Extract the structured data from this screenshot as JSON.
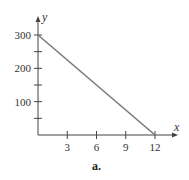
{
  "chart_data": {
    "type": "line",
    "title": "",
    "caption": "a.",
    "xlabel": "x",
    "ylabel": "y",
    "xlim": [
      0,
      12
    ],
    "ylim": [
      0,
      300
    ],
    "x_ticks": [
      3,
      6,
      9,
      12
    ],
    "x_tick_labels": [
      "3",
      "6",
      "9",
      "12"
    ],
    "y_ticks": [
      50,
      100,
      150,
      200,
      250,
      300
    ],
    "y_tick_labels": [
      "",
      "100",
      "",
      "200",
      "",
      "300"
    ],
    "grid": false,
    "legend": null,
    "series": [
      {
        "name": "line",
        "x": [
          0,
          12
        ],
        "y": [
          300,
          0
        ],
        "color": "#7a7a7a"
      }
    ]
  },
  "colors": {
    "axis": "#444444",
    "line": "#7a7a7a"
  }
}
